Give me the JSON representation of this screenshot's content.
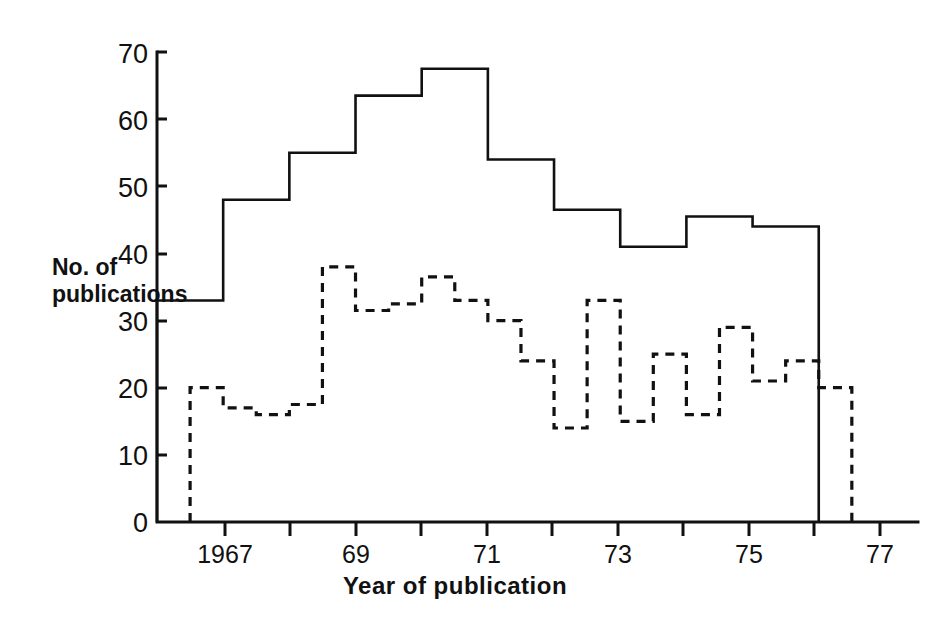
{
  "chart_data": {
    "type": "line",
    "subtype": "overlaid-step-histograms",
    "title": "",
    "xlabel": "Year of publication",
    "ylabel": "No. of publications",
    "ylabel_lines": [
      "No. of",
      "publications"
    ],
    "xlim": [
      1966.5,
      1978.0
    ],
    "ylim": [
      0,
      70
    ],
    "ytick_values": [
      0,
      10,
      20,
      30,
      40,
      50,
      60,
      70
    ],
    "ytick_labels": [
      "0",
      "10",
      "20",
      "30",
      "40",
      "50",
      "60",
      "70"
    ],
    "xtick_values": [
      1967,
      1969,
      1971,
      1973,
      1975,
      1977
    ],
    "xtick_labels": [
      "1967",
      "69",
      "71",
      "73",
      "75",
      "77"
    ],
    "minor_xtick_values": [
      1968,
      1970,
      1972,
      1974,
      1976,
      1978
    ],
    "grid": false,
    "legend": null,
    "series": [
      {
        "name": "solid-histogram",
        "style": "solid",
        "color": "#111111",
        "bin_start": 1966.5,
        "bin_width": 1.0,
        "values": [
          33,
          48,
          55,
          63.5,
          67.5,
          54,
          46.5,
          41,
          45.5,
          44
        ]
      },
      {
        "name": "dashed-histogram",
        "style": "dashed",
        "color": "#111111",
        "bin_start": 1967.0,
        "bin_width": 0.5,
        "values": [
          20,
          17,
          16,
          17.5,
          38,
          31.5,
          32.5,
          36.5,
          33,
          30,
          24,
          14,
          33,
          15,
          25,
          16,
          29,
          21,
          24,
          20
        ]
      }
    ]
  },
  "figure": {
    "background_color": "#ffffff",
    "axis_color": "#111111"
  }
}
